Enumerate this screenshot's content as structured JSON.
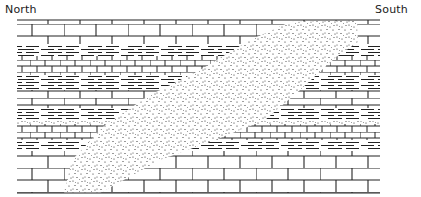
{
  "labels": {
    "left": "North",
    "right": "South"
  },
  "diagram": {
    "type": "geological-cross-section",
    "ink_color": "#222222",
    "background": "#ffffff",
    "frame": {
      "x": 17,
      "y": 20,
      "width": 363,
      "height": 173
    },
    "layers_top_to_bottom": [
      {
        "kind": "limestone-large",
        "y0": 20,
        "y1": 44
      },
      {
        "kind": "shale",
        "y0": 44,
        "y1": 56
      },
      {
        "kind": "limestone-small",
        "y0": 56,
        "y1": 75
      },
      {
        "kind": "shale",
        "y0": 75,
        "y1": 90
      },
      {
        "kind": "limestone-large",
        "y0": 90,
        "y1": 108
      },
      {
        "kind": "shale",
        "y0": 108,
        "y1": 121
      },
      {
        "kind": "stipple-band",
        "y0": 121,
        "y1": 124
      },
      {
        "kind": "limestone-small",
        "y0": 124,
        "y1": 140
      },
      {
        "kind": "shale",
        "y0": 140,
        "y1": 151
      },
      {
        "kind": "limestone-large",
        "y0": 151,
        "y1": 193
      }
    ],
    "sand_body": {
      "kind": "stipple",
      "description": "diagonal dotted sandstone body rising from lower-left to upper-right",
      "polygon": "64,193 100,193 160,160 215,140 265,120 300,90 335,58 358,42 357,20 290,22 250,40 200,70 150,95 105,125 72,160"
    }
  }
}
